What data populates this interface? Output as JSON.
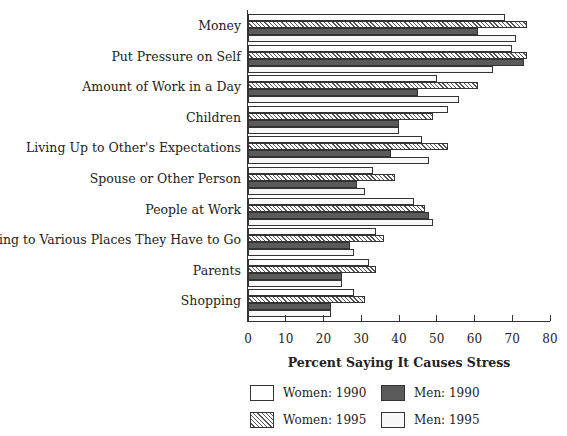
{
  "chart_data": {
    "type": "bar",
    "orientation": "horizontal",
    "title": "",
    "xlabel": "Percent Saying It Causes Stress",
    "ylabel": "",
    "xlim": [
      0,
      80
    ],
    "x_ticks": [
      "0",
      "10",
      "20",
      "30",
      "40",
      "50",
      "60",
      "70",
      "80"
    ],
    "grid": false,
    "legend_position": "bottom",
    "categories": [
      "Money",
      "Put Pressure on Self",
      "Amount of Work in a Day",
      "Children",
      "Living Up to Other's Expectations",
      "Spouse or Other Person",
      "People at Work",
      "Driving to Various Places They Have to Go",
      "Parents",
      "Shopping"
    ],
    "series": [
      {
        "name": "Women: 1990",
        "key": "w90",
        "values": [
          68,
          70,
          50,
          53,
          46,
          33,
          44,
          34,
          32,
          28
        ]
      },
      {
        "name": "Women: 1995",
        "key": "w95",
        "values": [
          74,
          74,
          61,
          49,
          53,
          39,
          47,
          36,
          34,
          31
        ]
      },
      {
        "name": "Men: 1990",
        "key": "m90",
        "values": [
          61,
          73,
          45,
          40,
          38,
          29,
          48,
          27,
          25,
          22
        ]
      },
      {
        "name": "Men: 1995",
        "key": "m95",
        "values": [
          71,
          65,
          56,
          40,
          48,
          31,
          49,
          28,
          25,
          22
        ]
      }
    ]
  },
  "legend": [
    {
      "label": "Women: 1990",
      "key": "w90"
    },
    {
      "label": "Men: 1990",
      "key": "m90"
    },
    {
      "label": "Women: 1995",
      "key": "w95"
    },
    {
      "label": "Men: 1995",
      "key": "m95"
    }
  ]
}
